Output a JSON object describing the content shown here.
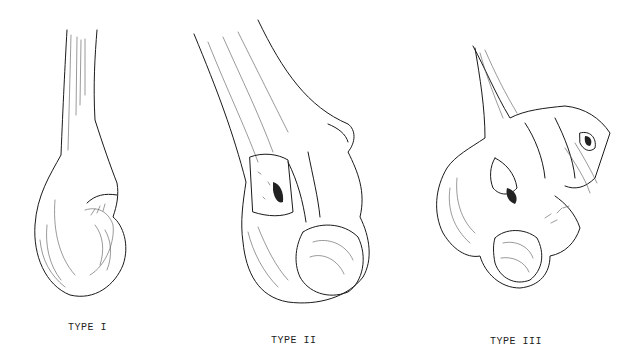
{
  "figures": [
    {
      "id": "type-1",
      "label": "TYPE I"
    },
    {
      "id": "type-2",
      "label": "TYPE II"
    },
    {
      "id": "type-3",
      "label": "TYPE III"
    }
  ],
  "colors": {
    "background": "#ffffff",
    "ink": "#1a1a1a"
  }
}
